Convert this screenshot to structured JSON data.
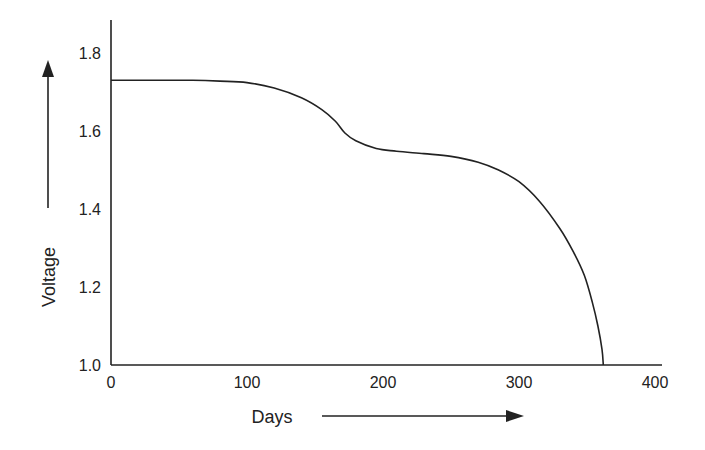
{
  "chart_data": {
    "type": "line",
    "title": "",
    "xlabel": "Days",
    "ylabel": "Voltage",
    "xlim": [
      0,
      400
    ],
    "ylim": [
      1.0,
      1.8
    ],
    "x_ticks": [
      "0",
      "100",
      "200",
      "300",
      "400"
    ],
    "y_ticks": [
      "1.0",
      "1.2",
      "1.4",
      "1.6",
      "1.8"
    ],
    "grid": false,
    "legend": null,
    "series": [
      {
        "name": "Voltage discharge curve",
        "x": [
          0,
          20,
          40,
          60,
          80,
          100,
          120,
          140,
          155,
          165,
          172,
          180,
          195,
          210,
          230,
          250,
          270,
          285,
          300,
          315,
          330,
          340,
          348,
          354,
          358,
          361,
          362
        ],
        "y": [
          1.73,
          1.73,
          1.73,
          1.73,
          1.728,
          1.724,
          1.71,
          1.685,
          1.655,
          1.625,
          1.595,
          1.575,
          1.555,
          1.548,
          1.542,
          1.535,
          1.52,
          1.5,
          1.47,
          1.42,
          1.35,
          1.29,
          1.23,
          1.16,
          1.1,
          1.04,
          1.0
        ]
      }
    ]
  }
}
